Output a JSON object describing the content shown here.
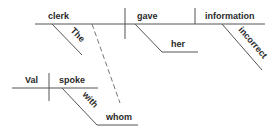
{
  "diagram": {
    "type": "Reed-Kellogg sentence diagram",
    "main_clause": {
      "subject": "clerk",
      "subject_modifier": "The",
      "verb": "gave",
      "indirect_object": "her",
      "direct_object": "information",
      "object_modifier": "incorrect"
    },
    "relative_clause": {
      "subject": "Val",
      "verb": "spoke",
      "preposition": "with",
      "prepositional_object": "whom"
    },
    "colors": {
      "line": "#555555",
      "text": "#2a2a2a",
      "dashed_connector": "#777777",
      "background": "#ffffff"
    }
  }
}
